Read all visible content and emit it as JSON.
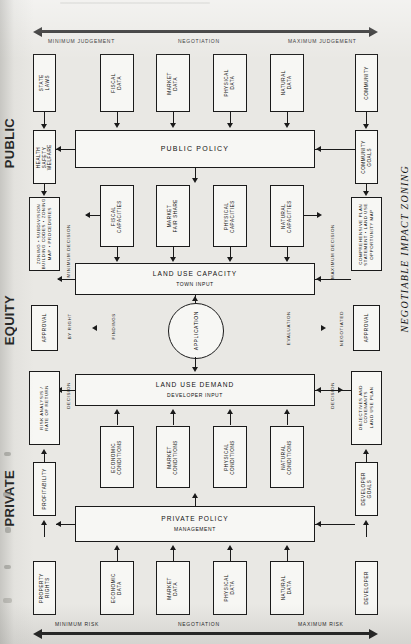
{
  "title": "NEGOTIABLE IMPACT ZONING",
  "sections": [
    {
      "name": "PUBLIC"
    },
    {
      "name": "EQUITY"
    },
    {
      "name": "PRIVATE"
    }
  ],
  "top_scale": {
    "left": "MINIMUM JUDGEMENT",
    "center": "NEGOTIATION",
    "right": "MAXIMUM JUDGEMENT"
  },
  "bottom_scale": {
    "left": "MINIMUM RISK",
    "center": "NEGOTIATION",
    "right": "MAXIMUM RISK"
  },
  "public": {
    "left_chain": [
      {
        "label": "STATE\nLAWS"
      },
      {
        "label": "HEALTH\nSAFETY\nWELFARE"
      },
      {
        "label": "ZONING • SUBDIVISION\nBUILDING CODES • ZONING\nMAP • PROCEDURES"
      }
    ],
    "right_chain": [
      {
        "label": "COMMUNITY"
      },
      {
        "label": "COMMUNITY\nGOALS"
      },
      {
        "label": "COMPREHENSIVE PLAN\nSTATEMENT • LAND USE\nOPPORTUNITY MAP"
      }
    ],
    "data_row": [
      {
        "label": "FISCAL\nDATA"
      },
      {
        "label": "MARKET\nDATA"
      },
      {
        "label": "PHYSICAL\nDATA"
      },
      {
        "label": "NATURAL\nDATA"
      }
    ],
    "policy_bar": {
      "line1": "PUBLIC   POLICY"
    },
    "capacity_row": [
      {
        "label": "FISCAL\nCAPACITIES"
      },
      {
        "label": "MARKET\nFAIR SHARE"
      },
      {
        "label": "PHYSICAL\nCAPACITIES"
      },
      {
        "label": "NATURAL\nCAPACITIES"
      }
    ],
    "capacity_bar": {
      "line1": "LAND     USE     CAPACITY",
      "line2": "TOWN INPUT"
    },
    "edge_labels": {
      "left": "MINIMUM DECISION",
      "right": "MAXIMUM DECISION"
    }
  },
  "equity": {
    "left_box": {
      "label": "APPROVAL"
    },
    "right_box": {
      "label": "APPROVAL"
    },
    "left_labels": {
      "outer": "BY RIGHT",
      "inner": "FINDINGS"
    },
    "right_labels": {
      "inner": "EVALUATION",
      "outer": "NEGOTIATED"
    },
    "center_circle": {
      "label": "APPLICATION"
    }
  },
  "private": {
    "demand_bar": {
      "line1": "LAND     USE     DEMAND",
      "line2": "DEVELOPER INPUT"
    },
    "conditions_row": [
      {
        "label": "ECONOMIC\nCONDITIONS"
      },
      {
        "label": "MARKET\nCONDITIONS"
      },
      {
        "label": "PHYSICAL\nCONDITIONS"
      },
      {
        "label": "NATURAL\nCONDITIONS"
      }
    ],
    "policy_bar": {
      "line1": "PRIVATE   POLICY",
      "line2": "MANAGEMENT"
    },
    "data_row": [
      {
        "label": "ECONOMIC\nDATA"
      },
      {
        "label": "MARKET\nDATA"
      },
      {
        "label": "PHYSICAL\nDATA"
      },
      {
        "label": "NATURAL\nDATA"
      }
    ],
    "left_chain": [
      {
        "label": "RISK ANALYSIS /\nRATE OF RETURN"
      },
      {
        "label": "PROFITABILITY"
      },
      {
        "label": "PROPERTY\nRIGHTS"
      }
    ],
    "right_chain": [
      {
        "label": "OBJECTIVES AND\nCOVENANTS\nLAND USE PLAN"
      },
      {
        "label": "DEVELOPER\nGOALS"
      },
      {
        "label": "DEVELOPER"
      }
    ],
    "edge_labels": {
      "left": "DECISION",
      "right": "DECISION"
    }
  },
  "colors": {
    "ink": "#1a1a1a",
    "paper": "#f7f7f4",
    "bg": "#e9e8e4"
  }
}
